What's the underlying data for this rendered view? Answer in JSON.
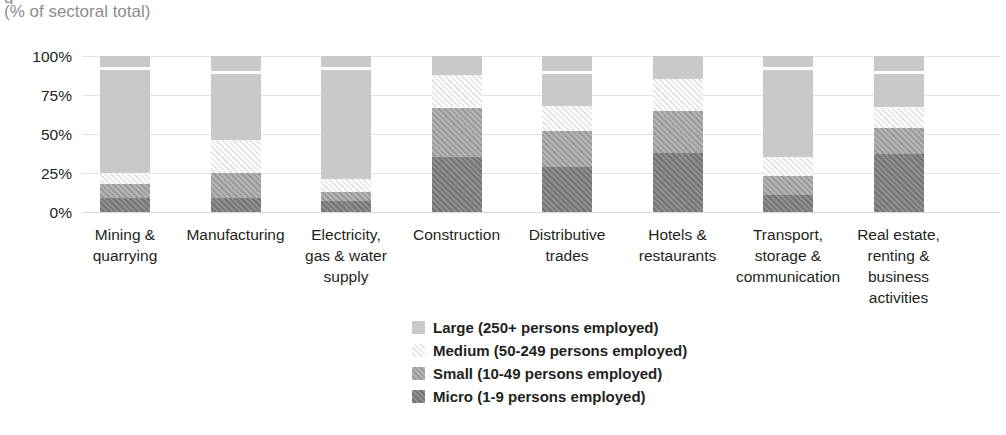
{
  "header": {
    "title_cut": "g",
    "subtitle": "(% of sectoral total)"
  },
  "chart_data": {
    "type": "bar",
    "stacked": true,
    "normalized": true,
    "title": "",
    "subtitle": "(% of sectoral total)",
    "xlabel": "",
    "ylabel": "",
    "ylim": [
      0,
      100
    ],
    "ytick_labels": [
      "100%",
      "75%",
      "50%",
      "25%",
      "0%"
    ],
    "ytick_values": [
      100,
      75,
      50,
      25,
      0
    ],
    "grid": true,
    "legend_position": "bottom-center",
    "categories": [
      "Mining & quarrying",
      "Manufacturing",
      "Electricity, gas & water supply",
      "Construction",
      "Distributive trades",
      "Hotels & restaurants",
      "Transport, storage & communication",
      "Real estate, renting & business activities"
    ],
    "category_lines": [
      [
        "Mining &",
        "quarrying"
      ],
      [
        "Manufacturing"
      ],
      [
        "Electricity,",
        "gas & water",
        "supply"
      ],
      [
        "Construction"
      ],
      [
        "Distributive",
        "trades"
      ],
      [
        "Hotels &",
        "restaurants"
      ],
      [
        "Transport,",
        "storage &",
        "communication"
      ],
      [
        "Real estate,",
        "renting &",
        "business",
        "activities"
      ]
    ],
    "series": [
      {
        "name": "Micro (1-9 persons employed)",
        "key": "micro",
        "color": "#8a8a8a",
        "values": [
          9,
          9,
          7,
          35,
          29,
          38,
          11,
          37
        ]
      },
      {
        "name": "Small (10-49 persons employed)",
        "key": "small",
        "color": "#a8a8a8",
        "values": [
          9,
          16,
          6,
          32,
          23,
          27,
          12,
          17
        ]
      },
      {
        "name": "Medium (50-249 persons employed)",
        "key": "medium",
        "color": "#f2f2f2",
        "values": [
          7,
          21,
          8,
          21,
          16,
          20,
          12,
          13
        ]
      },
      {
        "name": "Large (250+ persons employed)",
        "key": "large",
        "color": "#c9c9c9",
        "values": [
          75,
          54,
          79,
          12,
          32,
          15,
          65,
          33
        ]
      }
    ]
  },
  "legend": {
    "items": [
      {
        "key": "large",
        "label": "Large (250+ persons employed)"
      },
      {
        "key": "medium",
        "label": "Medium (50-249 persons employed)"
      },
      {
        "key": "small",
        "label": "Small (10-49 persons employed)"
      },
      {
        "key": "micro",
        "label": "Micro (1-9 persons employed)"
      }
    ]
  }
}
